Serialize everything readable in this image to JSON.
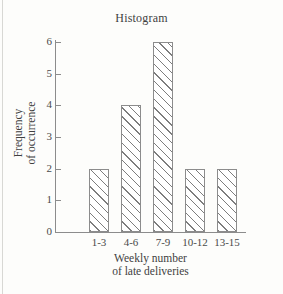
{
  "chart_data": {
    "type": "bar",
    "title": "Histogram",
    "categories": [
      "1-3",
      "4-6",
      "7-9",
      "10-12",
      "13-15"
    ],
    "values": [
      2,
      4,
      6,
      2,
      2
    ],
    "xlabel_line1": "Weekly number",
    "xlabel_line2": "of late deliveries",
    "ylabel_line1": "Frequency",
    "ylabel_line2": "of occurrence",
    "ylim": [
      0,
      6
    ],
    "y_ticks": [
      "0",
      "1",
      "2",
      "3",
      "4",
      "5",
      "6"
    ],
    "grid": false,
    "legend": "none",
    "bar_fill": "#ffffff",
    "bar_hatch": "diagonal-lines-45",
    "bar_edge_color": "#8c8c8c",
    "axis_color": "#8c8c8c",
    "text_color": "#4a4a4a",
    "background": "#fdfdfb"
  }
}
